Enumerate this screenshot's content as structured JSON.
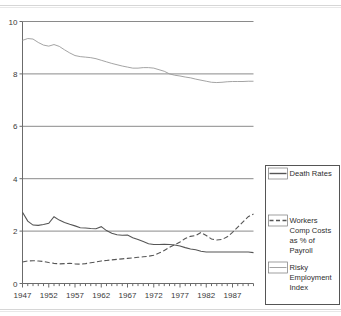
{
  "chart_data": {
    "type": "line",
    "title": "",
    "subtitle": "",
    "xlabel": "",
    "ylabel": "",
    "xlim": [
      1947,
      1991
    ],
    "ylim": [
      0,
      10
    ],
    "yticks": [
      0,
      2,
      4,
      6,
      8,
      10
    ],
    "ytick_labels": [
      "0",
      "2",
      "4",
      "6",
      "8",
      "10"
    ],
    "xticks": [
      1947,
      1952,
      1957,
      1962,
      1967,
      1972,
      1977,
      1982,
      1987
    ],
    "xtick_labels": [
      "1947",
      "1952",
      "1957",
      "1962",
      "1967",
      "1972",
      "1977",
      "1982",
      "1987"
    ],
    "xtick_minor_step": 1,
    "grid": "horizontal",
    "legend_position": "right",
    "x": [
      1947,
      1948,
      1949,
      1950,
      1951,
      1952,
      1953,
      1954,
      1955,
      1956,
      1957,
      1958,
      1959,
      1960,
      1961,
      1962,
      1963,
      1964,
      1965,
      1966,
      1967,
      1968,
      1969,
      1970,
      1971,
      1972,
      1973,
      1974,
      1975,
      1976,
      1977,
      1978,
      1979,
      1980,
      1981,
      1982,
      1983,
      1984,
      1985,
      1986,
      1987,
      1988,
      1989,
      1990,
      1991
    ],
    "series": [
      {
        "name": "Death Rates",
        "style": "solid",
        "color": "#555555",
        "values": [
          2.72,
          2.38,
          2.23,
          2.22,
          2.25,
          2.3,
          2.55,
          2.42,
          2.33,
          2.26,
          2.2,
          2.13,
          2.12,
          2.1,
          2.09,
          2.17,
          2.02,
          1.92,
          1.86,
          1.84,
          1.85,
          1.75,
          1.68,
          1.6,
          1.52,
          1.49,
          1.49,
          1.5,
          1.49,
          1.47,
          1.43,
          1.37,
          1.32,
          1.29,
          1.23,
          1.2,
          1.2,
          1.2,
          1.2,
          1.2,
          1.2,
          1.2,
          1.2,
          1.2,
          1.18
        ]
      },
      {
        "name": "Workers Comp Costs as % of Payroll",
        "style": "dashed",
        "color": "#555555",
        "values": [
          0.82,
          0.86,
          0.87,
          0.86,
          0.84,
          0.8,
          0.77,
          0.75,
          0.76,
          0.77,
          0.75,
          0.74,
          0.76,
          0.79,
          0.82,
          0.86,
          0.88,
          0.9,
          0.92,
          0.94,
          0.96,
          0.98,
          1.0,
          1.02,
          1.04,
          1.08,
          1.16,
          1.26,
          1.38,
          1.48,
          1.58,
          1.72,
          1.8,
          1.83,
          1.95,
          1.83,
          1.7,
          1.66,
          1.68,
          1.78,
          1.95,
          2.15,
          2.35,
          2.55,
          2.65
        ]
      },
      {
        "name": "Risky Employment Index",
        "style": "solid-light",
        "color": "#9a9a9a",
        "values": [
          9.28,
          9.35,
          9.33,
          9.2,
          9.1,
          9.06,
          9.12,
          9.05,
          8.92,
          8.8,
          8.7,
          8.66,
          8.64,
          8.62,
          8.58,
          8.52,
          8.46,
          8.4,
          8.35,
          8.3,
          8.26,
          8.22,
          8.22,
          8.24,
          8.24,
          8.22,
          8.16,
          8.1,
          8.0,
          7.95,
          7.92,
          7.88,
          7.85,
          7.8,
          7.76,
          7.72,
          7.68,
          7.67,
          7.68,
          7.7,
          7.71,
          7.71,
          7.71,
          7.72,
          7.72
        ]
      }
    ]
  },
  "legend": {
    "items": [
      {
        "label": "Death Rates",
        "swatch": "solid"
      },
      {
        "label": "Workers Comp Costs as % of Payroll",
        "swatch": "dashed"
      },
      {
        "label": "Risky Employment Index",
        "swatch": "solid-light"
      }
    ],
    "item_1_lines": [
      "Death Rates"
    ],
    "item_2_lines": [
      "Workers",
      "Comp Costs",
      "as % of",
      "Payroll"
    ],
    "item_3_lines": [
      "Risky",
      "Employment",
      "Index"
    ]
  },
  "colors": {
    "background": "#ffffff",
    "axis": "#6b6b6b",
    "grid": "#8a8a8a",
    "series_dark": "#555555",
    "series_light": "#9a9a9a",
    "text": "#3a3a3a",
    "edge_rule": "#d6d6d6"
  }
}
